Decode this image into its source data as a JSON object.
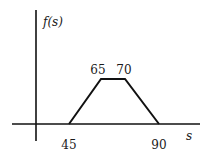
{
  "diagram": {
    "type": "trapezoidal-distribution",
    "y_axis_label": "f(s)",
    "x_axis_label": "s",
    "points": [
      {
        "s": 45,
        "label": "45",
        "position": "below-axis"
      },
      {
        "s": 65,
        "label": "65",
        "position": "above-peak"
      },
      {
        "s": 70,
        "label": "70",
        "position": "above-peak"
      },
      {
        "s": 90,
        "label": "90",
        "position": "below-axis"
      }
    ],
    "colors": {
      "line": "#111111",
      "text": "#1a1a1a",
      "background": "#ffffff"
    }
  }
}
